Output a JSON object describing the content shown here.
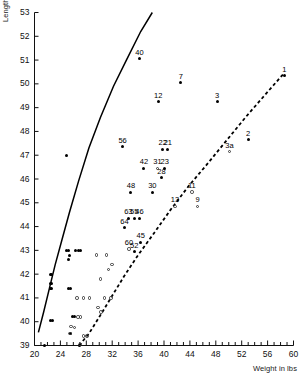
{
  "chart_data": {
    "type": "scatter",
    "title": "",
    "xlabel": "Weight in lbs",
    "ylabel": "Length in inches",
    "xlim": [
      20,
      60
    ],
    "ylim": [
      39,
      53
    ],
    "xticks_major": [
      20,
      24,
      28,
      32,
      36,
      40,
      44,
      48,
      52,
      56,
      60
    ],
    "xtick_step_minor": 1,
    "yticks": [
      39,
      40,
      41,
      42,
      43,
      44,
      45,
      46,
      47,
      48,
      49,
      50,
      51,
      52,
      53
    ],
    "grid": false,
    "legend": null,
    "series": [
      {
        "name": "labelled filled specimens",
        "marker": "filled-circle",
        "points": [
          {
            "label": "40",
            "x": 36.2,
            "y": 51.05
          },
          {
            "label": "1",
            "x": 58.6,
            "y": 50.35
          },
          {
            "label": "7",
            "x": 42.6,
            "y": 50.05
          },
          {
            "label": "12",
            "x": 39.1,
            "y": 49.25
          },
          {
            "label": "3",
            "x": 48.2,
            "y": 49.25
          },
          {
            "label": "2",
            "x": 53.0,
            "y": 47.65
          },
          {
            "label": "56",
            "x": 33.6,
            "y": 47.35
          },
          {
            "label": "22",
            "x": 39.8,
            "y": 47.25
          },
          {
            "label": "21",
            "x": 40.6,
            "y": 47.25
          },
          {
            "label": "42",
            "x": 36.9,
            "y": 46.45
          },
          {
            "label": "23",
            "x": 40.1,
            "y": 46.45
          },
          {
            "label": "28",
            "x": 39.6,
            "y": 46.05
          },
          {
            "label": "48",
            "x": 34.9,
            "y": 45.45
          },
          {
            "label": "30",
            "x": 38.2,
            "y": 45.45
          },
          {
            "label": "63",
            "x": 34.5,
            "y": 44.35
          },
          {
            "label": "46",
            "x": 36.2,
            "y": 44.35
          },
          {
            "label": "55",
            "x": 35.4,
            "y": 44.35
          },
          {
            "label": "64",
            "x": 33.9,
            "y": 43.95
          },
          {
            "label": "45",
            "x": 36.4,
            "y": 43.35
          },
          {
            "label": "52",
            "x": 35.4,
            "y": 42.95
          }
        ]
      },
      {
        "name": "labelled open specimens",
        "marker": "open-circle",
        "points": [
          {
            "label": "3a",
            "x": 50.1,
            "y": 47.15
          },
          {
            "label": "31",
            "x": 39.0,
            "y": 46.45
          },
          {
            "label": "11",
            "x": 44.3,
            "y": 45.45
          },
          {
            "label": "13",
            "x": 41.7,
            "y": 44.85
          },
          {
            "label": "9",
            "x": 45.2,
            "y": 44.85
          },
          {
            "label": "60",
            "x": 34.6,
            "y": 43.05
          }
        ]
      },
      {
        "name": "unlabelled filled specimens",
        "marker": "filled-circle",
        "points": [
          {
            "x": 25.0,
            "y": 47.0
          },
          {
            "x": 24.9,
            "y": 43.0
          },
          {
            "x": 25.2,
            "y": 43.0
          },
          {
            "x": 26.4,
            "y": 43.0
          },
          {
            "x": 26.8,
            "y": 43.0
          },
          {
            "x": 27.1,
            "y": 43.0
          },
          {
            "x": 25.4,
            "y": 42.8
          },
          {
            "x": 25.3,
            "y": 42.6
          },
          {
            "x": 22.4,
            "y": 42.0
          },
          {
            "x": 22.6,
            "y": 42.0
          },
          {
            "x": 22.4,
            "y": 41.6
          },
          {
            "x": 22.6,
            "y": 41.6
          },
          {
            "x": 22.4,
            "y": 41.4
          },
          {
            "x": 22.7,
            "y": 41.4
          },
          {
            "x": 25.2,
            "y": 41.4
          },
          {
            "x": 25.5,
            "y": 41.4
          },
          {
            "x": 22.4,
            "y": 40.05
          },
          {
            "x": 22.8,
            "y": 40.05
          },
          {
            "x": 25.9,
            "y": 40.2
          },
          {
            "x": 26.2,
            "y": 40.2
          },
          {
            "x": 25.6,
            "y": 39.5
          },
          {
            "x": 21.6,
            "y": 39.0
          },
          {
            "x": 26.9,
            "y": 39.0
          }
        ]
      },
      {
        "name": "unlabelled open specimens",
        "marker": "open-circle",
        "points": [
          {
            "x": 29.6,
            "y": 42.8
          },
          {
            "x": 31.1,
            "y": 42.8
          },
          {
            "x": 32.0,
            "y": 42.4
          },
          {
            "x": 31.4,
            "y": 42.2
          },
          {
            "x": 30.2,
            "y": 41.8
          },
          {
            "x": 26.6,
            "y": 41.0
          },
          {
            "x": 27.6,
            "y": 41.0
          },
          {
            "x": 28.5,
            "y": 41.0
          },
          {
            "x": 30.8,
            "y": 41.0
          },
          {
            "x": 31.8,
            "y": 41.0
          },
          {
            "x": 29.8,
            "y": 40.6
          },
          {
            "x": 30.3,
            "y": 40.4
          },
          {
            "x": 26.7,
            "y": 40.2
          },
          {
            "x": 27.1,
            "y": 40.2
          },
          {
            "x": 25.6,
            "y": 39.8
          },
          {
            "x": 26.2,
            "y": 39.75
          },
          {
            "x": 25.5,
            "y": 39.5
          },
          {
            "x": 27.6,
            "y": 39.4
          },
          {
            "x": 28.1,
            "y": 39.4
          },
          {
            "x": 27.0,
            "y": 39.05
          }
        ]
      }
    ],
    "curves": [
      {
        "name": "upper-solid-curve",
        "style": "solid",
        "points": [
          [
            20.6,
            39.55
          ],
          [
            21.4,
            40.4
          ],
          [
            22.3,
            41.4
          ],
          [
            23.2,
            42.4
          ],
          [
            24.2,
            43.4
          ],
          [
            25.4,
            44.6
          ],
          [
            26.8,
            45.9
          ],
          [
            28.4,
            47.3
          ],
          [
            30.2,
            48.6
          ],
          [
            32.2,
            49.9
          ],
          [
            34.2,
            51.0
          ],
          [
            36.4,
            52.2
          ],
          [
            38.2,
            53.0
          ]
        ]
      },
      {
        "name": "lower-dashed-curve",
        "style": "dashed",
        "points": [
          [
            26.9,
            39.0
          ],
          [
            28.4,
            39.5
          ],
          [
            30.0,
            40.2
          ],
          [
            31.8,
            41.0
          ],
          [
            33.8,
            41.9
          ],
          [
            36.0,
            42.8
          ],
          [
            38.4,
            43.7
          ],
          [
            41.0,
            44.7
          ],
          [
            43.8,
            45.7
          ],
          [
            46.6,
            46.6
          ],
          [
            49.6,
            47.6
          ],
          [
            52.6,
            48.6
          ],
          [
            55.8,
            49.6
          ],
          [
            58.4,
            50.4
          ]
        ]
      }
    ]
  }
}
